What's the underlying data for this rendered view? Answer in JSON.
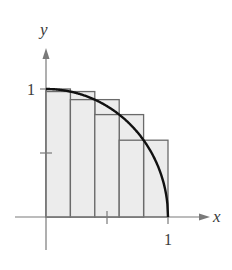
{
  "figure": {
    "function": "y = sqrt(1 - x^2)",
    "n_subintervals": 5,
    "axes": {
      "x_label": "x",
      "y_label": "y",
      "x_tick_label": "1",
      "y_tick_label": "1",
      "x_ticks": [
        0.5,
        1
      ],
      "y_ticks": [
        0.5,
        1
      ]
    },
    "upper_rectangles": [
      {
        "x0": 0.0,
        "x1": 0.2,
        "height": 1.0
      },
      {
        "x0": 0.2,
        "x1": 0.4,
        "height": 0.98
      },
      {
        "x0": 0.4,
        "x1": 0.6,
        "height": 0.917
      },
      {
        "x0": 0.6,
        "x1": 0.8,
        "height": 0.8
      },
      {
        "x0": 0.8,
        "x1": 1.0,
        "height": 0.6
      }
    ],
    "lower_rectangles": [
      {
        "x0": 0.0,
        "x1": 0.2,
        "height": 0.98
      },
      {
        "x0": 0.2,
        "x1": 0.4,
        "height": 0.917
      },
      {
        "x0": 0.4,
        "x1": 0.6,
        "height": 0.8
      },
      {
        "x0": 0.6,
        "x1": 0.8,
        "height": 0.6
      },
      {
        "x0": 0.8,
        "x1": 1.0,
        "height": 0.0
      }
    ],
    "colors": {
      "fill": "#ececec",
      "rect_stroke": "#6a6a6a",
      "curve": "#111111",
      "axis": "#7a7a7a"
    }
  }
}
